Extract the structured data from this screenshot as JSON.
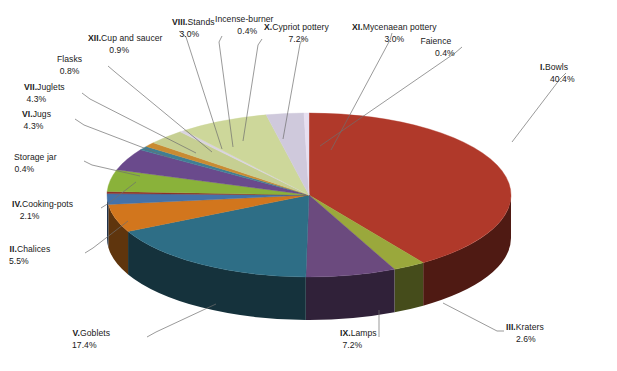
{
  "chart_data": {
    "type": "pie",
    "title": "",
    "subtitle": "",
    "xlabel": "",
    "ylabel": "",
    "legend_position": "none",
    "grid": false,
    "style": "3d-exploded-pie",
    "units": "percent",
    "categories": [
      "I.Bowls",
      "III.Kraters",
      "IX.Lamps",
      "V.Goblets",
      "II.Chalices",
      "IV.Cooking-pots",
      "Storage jar",
      "VI.Jugs",
      "VII.Juglets",
      "Flasks",
      "XII.Cup and saucer",
      "VIII.Stands",
      "Incense-burner",
      "X.Cypriot pottery",
      "XI.Mycenaean pottery",
      "Faience"
    ],
    "values": [
      40.4,
      2.6,
      7.2,
      17.4,
      5.5,
      2.1,
      0.4,
      4.3,
      4.3,
      0.8,
      0.9,
      3.0,
      0.4,
      7.2,
      3.0,
      0.4
    ],
    "colors": [
      "#b0392a",
      "#9aa83c",
      "#6b4a7e",
      "#2e6e86",
      "#d2761d",
      "#4472a8",
      "#8d2f28",
      "#8ab23a",
      "#6a4a8c",
      "#3f7f95",
      "#c98b32",
      "#c6cf92",
      "#d9d3e0",
      "#cdd79a",
      "#cfc9dc",
      "#e7dff0"
    ],
    "slices": [
      {
        "label": "I.Bowls",
        "roman": "I.",
        "name": "Bowls",
        "percent": "40.4%",
        "value": 40.4,
        "color": "#b0392a"
      },
      {
        "label": "III.Kraters",
        "roman": "III.",
        "name": "Kraters",
        "percent": "2.6%",
        "value": 2.6,
        "color": "#9aa83c"
      },
      {
        "label": "IX.Lamps",
        "roman": "IX.",
        "name": "Lamps",
        "percent": "7.2%",
        "value": 7.2,
        "color": "#6b4a7e"
      },
      {
        "label": "V.Goblets",
        "roman": "V.",
        "name": "Goblets",
        "percent": "17.4%",
        "value": 17.4,
        "color": "#2e6e86"
      },
      {
        "label": "II.Chalices",
        "roman": "II.",
        "name": "Chalices",
        "percent": "5.5%",
        "value": 5.5,
        "color": "#d2761d"
      },
      {
        "label": "IV.Cooking-pots",
        "roman": "IV.",
        "name": "Cooking-pots",
        "percent": "2.1%",
        "value": 2.1,
        "color": "#4472a8"
      },
      {
        "label": "Storage jar",
        "roman": "",
        "name": "Storage jar",
        "percent": "0.4%",
        "value": 0.4,
        "color": "#8d2f28"
      },
      {
        "label": "VI.Jugs",
        "roman": "VI.",
        "name": "Jugs",
        "percent": "4.3%",
        "value": 4.3,
        "color": "#8ab23a"
      },
      {
        "label": "VII.Juglets",
        "roman": "VII.",
        "name": "Juglets",
        "percent": "4.3%",
        "value": 4.3,
        "color": "#6a4a8c"
      },
      {
        "label": "Flasks",
        "roman": "",
        "name": "Flasks",
        "percent": "0.8%",
        "value": 0.8,
        "color": "#3f7f95"
      },
      {
        "label": "XII.Cup and saucer",
        "roman": "XII.",
        "name": "Cup and saucer",
        "percent": "0.9%",
        "value": 0.9,
        "color": "#c98b32"
      },
      {
        "label": "VIII.Stands",
        "roman": "VIII.",
        "name": "Stands",
        "percent": "3.0%",
        "value": 3.0,
        "color": "#c6cf92"
      },
      {
        "label": "Incense-burner",
        "roman": "",
        "name": "Incense-burner",
        "percent": "0.4%",
        "value": 0.4,
        "color": "#d9d3e0"
      },
      {
        "label": "X.Cypriot pottery",
        "roman": "X.",
        "name": "Cypriot pottery",
        "percent": "7.2%",
        "value": 7.2,
        "color": "#cdd79a"
      },
      {
        "label": "XI.Mycenaean pottery",
        "roman": "XI.",
        "name": "Mycenaean pottery",
        "percent": "3.0%",
        "value": 3.0,
        "color": "#cfc9dc"
      },
      {
        "label": "Faience",
        "roman": "",
        "name": "Faience",
        "percent": "0.4%",
        "value": 0.4,
        "color": "#e7dff0"
      }
    ]
  },
  "labels": {
    "bowls": {
      "roman": "I.",
      "name": "Bowls",
      "percent": "40.4%"
    },
    "kraters": {
      "roman": "III.",
      "name": "Kraters",
      "percent": "2.6%"
    },
    "lamps": {
      "roman": "IX.",
      "name": "Lamps",
      "percent": "7.2%"
    },
    "goblets": {
      "roman": "V.",
      "name": "Goblets",
      "percent": "17.4%"
    },
    "chalices": {
      "roman": "II.",
      "name": "Chalices",
      "percent": "5.5%"
    },
    "cooking_pots": {
      "roman": "IV.",
      "name": "Cooking-pots",
      "percent": "2.1%"
    },
    "storage_jar": {
      "roman": "",
      "name": "Storage jar",
      "percent": "0.4%"
    },
    "jugs": {
      "roman": "VI.",
      "name": "Jugs",
      "percent": "4.3%"
    },
    "juglets": {
      "roman": "VII.",
      "name": "Juglets",
      "percent": "4.3%"
    },
    "flasks": {
      "roman": "",
      "name": "Flasks",
      "percent": "0.8%"
    },
    "cup_and_saucer": {
      "roman": "XII.",
      "name": "Cup and saucer",
      "percent": "0.9%"
    },
    "stands": {
      "roman": "VIII.",
      "name": "Stands",
      "percent": "3.0%"
    },
    "incense_burner": {
      "roman": "",
      "name": "Incense-burner",
      "percent": "0.4%"
    },
    "cypriot_pottery": {
      "roman": "X.",
      "name": "Cypriot pottery",
      "percent": "7.2%"
    },
    "mycenaean_pottery": {
      "roman": "XI.",
      "name": "Mycenaean pottery",
      "percent": "3.0%"
    },
    "faience": {
      "roman": "",
      "name": "Faience",
      "percent": "0.4%"
    }
  }
}
